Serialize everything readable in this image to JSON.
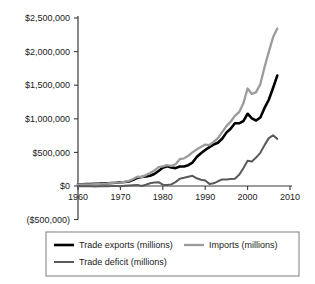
{
  "chart_data": {
    "type": "line",
    "title": "",
    "subtitle": "",
    "xlabel": "",
    "ylabel": "",
    "xlim": [
      1960,
      2010
    ],
    "ylim": [
      -500000,
      2500000
    ],
    "grid": false,
    "legend_position": "bottom",
    "x_ticks": [
      "1960",
      "1970",
      "1980",
      "1990",
      "2000",
      "2010"
    ],
    "x_tick_values": [
      1960,
      1970,
      1980,
      1990,
      2000,
      2010
    ],
    "y_ticks": [
      "$2,500,000",
      "$2,000,000",
      "$1,500,000",
      "$1,000,000",
      "$500,000",
      "$0",
      "($500,000)"
    ],
    "y_tick_values": [
      2500000,
      2000000,
      1500000,
      1000000,
      500000,
      0,
      -500000
    ],
    "x": [
      1960,
      1961,
      1962,
      1963,
      1964,
      1965,
      1966,
      1967,
      1968,
      1969,
      1970,
      1971,
      1972,
      1973,
      1974,
      1975,
      1976,
      1977,
      1978,
      1979,
      1980,
      1981,
      1982,
      1983,
      1984,
      1985,
      1986,
      1987,
      1988,
      1989,
      1990,
      1991,
      1992,
      1993,
      1994,
      1995,
      1996,
      1997,
      1998,
      1999,
      2000,
      2001,
      2002,
      2003,
      2004,
      2005,
      2006,
      2007
    ],
    "series": [
      {
        "name": "Trade exports (millions)",
        "color": "#000000",
        "width": 2.6,
        "values": [
          25940,
          26403,
          27722,
          29620,
          33341,
          35285,
          38926,
          41333,
          45543,
          49220,
          56640,
          59677,
          67222,
          91242,
          120897,
          132585,
          142716,
          152301,
          178428,
          224131,
          271834,
          294398,
          275236,
          266106,
          291094,
          289070,
          310033,
          348869,
          431149,
          487003,
          535233,
          578344,
          616882,
          642863,
          703254,
          794387,
          851602,
          934453,
          933174,
          965884,
          1075321,
          1005654,
          974721,
          1020418,
          1161549,
          1283753,
          1457642,
          1643168
        ]
      },
      {
        "name": "Imports (millions)",
        "color": "#9b9b9b",
        "width": 2.3,
        "values": [
          22432,
          22208,
          24352,
          25410,
          27319,
          30621,
          36043,
          38669,
          45293,
          49129,
          54386,
          62296,
          74906,
          103811,
          137278,
          132033,
          162109,
          193764,
          229870,
          281659,
          291241,
          310570,
          299391,
          323874,
          400166,
          410950,
          448572,
          500552,
          545715,
          580144,
          616097,
          609479,
          656094,
          713174,
          801747,
          890771,
          955667,
          1042726,
          1099314,
          1230207,
          1450391,
          1369173,
          1397552,
          1513988,
          1769931,
          1996393,
          2212044,
          2344576
        ]
      },
      {
        "name": "Trade deficit (millions)",
        "color": "#5a5a5a",
        "width": 2.0,
        "values": [
          -3508,
          -4195,
          -3370,
          -4210,
          -6022,
          -4664,
          -2883,
          -2664,
          -250,
          -91,
          -2254,
          2619,
          7684,
          12569,
          16381,
          -552,
          19393,
          41463,
          51442,
          57528,
          19407,
          16172,
          24155,
          57768,
          109072,
          121880,
          138539,
          151683,
          114566,
          93141,
          80864,
          31135,
          39212,
          70311,
          98493,
          96384,
          104065,
          108273,
          166140,
          264323,
          375070,
          363519,
          422831,
          493570,
          608382,
          712640,
          754402,
          701408
        ]
      }
    ]
  },
  "legend": {
    "entries": [
      {
        "label": "Trade exports (millions)",
        "color": "#000000"
      },
      {
        "label": "Imports (millions)",
        "color": "#9b9b9b"
      },
      {
        "label": "Trade deficit (millions)",
        "color": "#5a5a5a"
      }
    ]
  },
  "colors": {
    "axis": "#3a3a3a",
    "text": "#1a1a1a",
    "legend_border": "#7d7d7d",
    "background": "#ffffff"
  }
}
